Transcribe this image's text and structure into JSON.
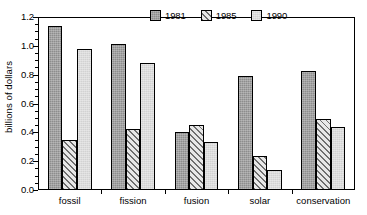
{
  "chart_data": {
    "type": "bar",
    "title": "",
    "subtitle": "",
    "xlabel": "",
    "ylabel": "billions of dollars",
    "categories": [
      "fossil",
      "fission",
      "fusion",
      "solar",
      "conservation"
    ],
    "series": [
      {
        "name": "1981",
        "color": "#8d8d8d",
        "pattern": "solid-dark-gray",
        "values": [
          1.14,
          1.015,
          0.405,
          0.79,
          0.825
        ]
      },
      {
        "name": "1985",
        "color": "#e8e8e8",
        "pattern": "diagonal-hatch",
        "values": [
          0.345,
          0.425,
          0.45,
          0.235,
          0.49
        ]
      },
      {
        "name": "1990",
        "color": "#d2d2d2",
        "pattern": "solid-light-gray",
        "values": [
          0.975,
          0.88,
          0.335,
          0.14,
          0.44
        ]
      }
    ],
    "ylim": [
      0.0,
      1.2
    ],
    "y_ticks": [
      0.0,
      0.2,
      0.4,
      0.6,
      0.8,
      1.0,
      1.2
    ],
    "y_tick_labels": [
      "0.0",
      "0.2",
      "0.4",
      "0.6",
      "0.8",
      "1.0",
      "1.2"
    ],
    "y_minor_tick_step": 0.05,
    "grid": false,
    "legend_position": "top-right-inside",
    "legend_entries": [
      "1981",
      "1985",
      "1990"
    ],
    "annotations": []
  }
}
